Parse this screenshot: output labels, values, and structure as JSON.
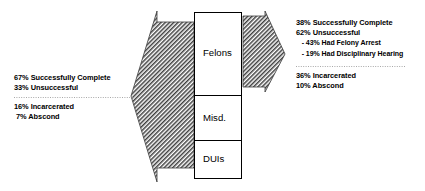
{
  "diagram": {
    "colors": {
      "ink": "#000000",
      "hatch": "#4a4a4a",
      "box_stroke": "#000000",
      "dotted": "#9a9a9a",
      "background": "#ffffff"
    },
    "left_panel": {
      "name": "entry-outcomes",
      "top_group": [
        "67% Successfully Complete",
        "33% Unsuccessful"
      ],
      "bottom_group": [
        "16% Incarcerated",
        " 7% Abscond"
      ]
    },
    "center_categories": [
      {
        "id": "felons",
        "label": "Felons"
      },
      {
        "id": "misd",
        "label": "Misd."
      },
      {
        "id": "duis",
        "label": "DUIs"
      }
    ],
    "right_panel": {
      "name": "exit-outcomes",
      "top_group": [
        "38% Successfully Complete",
        "62% Unsuccessful"
      ],
      "sub_group": [
        "   - 43% Had Felony Arrest",
        "   - 19% Had Disciplinary Hearing"
      ],
      "bottom_group": [
        "36% Incarcerated",
        "10% Abscond"
      ]
    },
    "arrows": {
      "left_arrow_name": "left-pointing-hatched-arrow",
      "right_arrow_name": "right-pointing-hatched-arrow"
    }
  }
}
